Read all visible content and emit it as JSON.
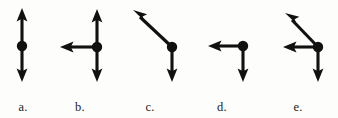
{
  "figure": {
    "title": "",
    "background_color": "#fdfdfc",
    "ink_color": "#111111",
    "width": 338,
    "height": 118,
    "panel_count": 5
  },
  "panels": [
    {
      "id": "a",
      "label": "a.",
      "description": "Two vectors of equal length pointing up and down from a common point",
      "origin": {
        "x": 22,
        "y": 46
      },
      "vector_count": 2,
      "vectors": [
        {
          "name": "up-arrow",
          "direction": "up",
          "angle_deg": 90,
          "dx": 0,
          "dy": -38,
          "tip": {
            "x": 22,
            "y": 8
          }
        },
        {
          "name": "down-arrow",
          "direction": "down",
          "angle_deg": 270,
          "dx": 0,
          "dy": 36,
          "tip": {
            "x": 22,
            "y": 82
          }
        }
      ]
    },
    {
      "id": "b",
      "label": "b.",
      "description": "Three vectors pointing up, down and left from a common point",
      "origin": {
        "x": 51,
        "y": 47
      },
      "vector_count": 3,
      "vectors": [
        {
          "name": "up-arrow",
          "direction": "up",
          "angle_deg": 90,
          "dx": 0,
          "dy": -38,
          "tip": {
            "x": 51,
            "y": 9
          }
        },
        {
          "name": "down-arrow",
          "direction": "down",
          "angle_deg": 270,
          "dx": 0,
          "dy": 35,
          "tip": {
            "x": 51,
            "y": 82
          }
        },
        {
          "name": "left-arrow",
          "direction": "left",
          "angle_deg": 180,
          "dx": -37,
          "dy": 0,
          "tip": {
            "x": 14,
            "y": 47
          }
        }
      ]
    },
    {
      "id": "c",
      "label": "c.",
      "description": "Two vectors: one pointing up and to the left diagonally, one pointing down",
      "origin": {
        "x": 58,
        "y": 47
      },
      "vector_count": 2,
      "vectors": [
        {
          "name": "up-left-diagonal-arrow",
          "direction": "up-left",
          "angle_deg": 136,
          "dx": -39,
          "dy": -37,
          "tip": {
            "x": 19,
            "y": 10
          }
        },
        {
          "name": "down-arrow",
          "direction": "down",
          "angle_deg": 270,
          "dx": 0,
          "dy": 35,
          "tip": {
            "x": 58,
            "y": 82
          }
        }
      ]
    },
    {
      "id": "d",
      "label": "d.",
      "description": "Two vectors: one pointing left, one pointing down",
      "origin": {
        "x": 57,
        "y": 46
      },
      "vector_count": 2,
      "vectors": [
        {
          "name": "left-arrow",
          "direction": "left",
          "angle_deg": 180,
          "dx": -35,
          "dy": 0,
          "tip": {
            "x": 22,
            "y": 46
          }
        },
        {
          "name": "down-arrow",
          "direction": "down",
          "angle_deg": 270,
          "dx": 0,
          "dy": 36,
          "tip": {
            "x": 57,
            "y": 82
          }
        }
      ]
    },
    {
      "id": "e",
      "label": "e.",
      "description": "Three vectors: one pointing up and to the left diagonally, one pointing left, one pointing down",
      "origin": {
        "x": 60,
        "y": 47
      },
      "vector_count": 3,
      "vectors": [
        {
          "name": "up-left-diagonal-arrow",
          "direction": "up-left",
          "angle_deg": 134,
          "dx": -33,
          "dy": -34,
          "tip": {
            "x": 27,
            "y": 13
          }
        },
        {
          "name": "left-arrow",
          "direction": "left",
          "angle_deg": 180,
          "dx": -35,
          "dy": 0,
          "tip": {
            "x": 25,
            "y": 47
          }
        },
        {
          "name": "down-arrow",
          "direction": "down",
          "angle_deg": 270,
          "dx": 0,
          "dy": 35,
          "tip": {
            "x": 60,
            "y": 82
          }
        }
      ]
    }
  ]
}
